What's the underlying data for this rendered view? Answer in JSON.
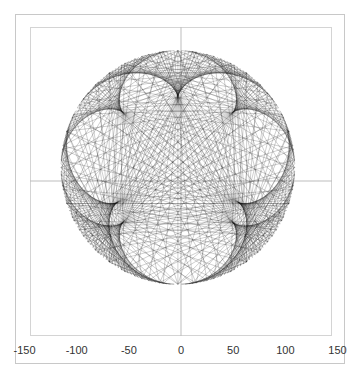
{
  "chart_data": {
    "type": "line",
    "title": "",
    "xlabel": "",
    "ylabel": "",
    "xlim": [
      -150,
      150
    ],
    "x_ticks": [
      -150,
      -100,
      -50,
      0,
      50,
      100,
      150
    ],
    "x_tick_labels": [
      "-150",
      "-100",
      "-50",
      "0",
      "50",
      "100",
      "150"
    ],
    "grid": false,
    "legend": null,
    "circle": {
      "center": [
        -3,
        13
      ],
      "radius": 112
    },
    "chords": {
      "n_points": 200,
      "multiplier": 5,
      "stroke": "#000000",
      "opacity": 0.55,
      "width": 0.35
    },
    "axes_lines": {
      "x_axis_y": 0,
      "y_axis_x": 0,
      "color": "#bdbdbd"
    }
  }
}
